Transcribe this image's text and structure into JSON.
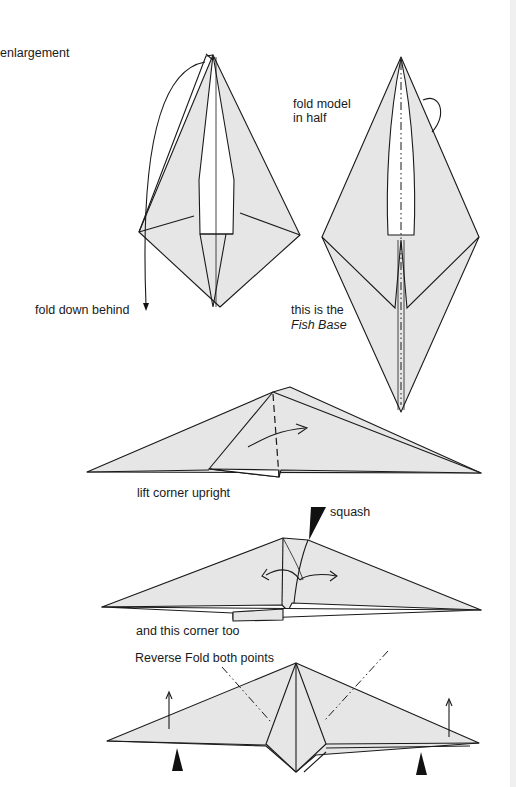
{
  "page": {
    "type": "origami instruction diagram",
    "colors": {
      "paper": "#e6e6e6",
      "ink": "#1a1a1a",
      "background": "#ffffff"
    }
  },
  "labels": {
    "enlargement": "enlargement",
    "fold_down_behind": "fold down behind",
    "fold_model_line1": "fold model",
    "fold_model_line2": "in half",
    "fish_base_line1": "this is the",
    "fish_base_line2": "Fish Base",
    "lift_corner": "lift corner upright",
    "squash": "squash",
    "this_corner_too": "and this corner too",
    "reverse_fold": "Reverse Fold both points"
  },
  "steps": [
    {
      "id": "step-1",
      "caption": "fold down behind",
      "symbols": [
        "curved-arrow",
        "down-arrow"
      ]
    },
    {
      "id": "step-2",
      "caption": "fold model in half / this is the Fish Base",
      "symbols": [
        "mountain-fold-line",
        "rotate-arrow"
      ]
    },
    {
      "id": "step-3",
      "caption": "lift corner upright",
      "symbols": [
        "valley-fold-line",
        "curved-arrow"
      ]
    },
    {
      "id": "step-4",
      "caption": "squash / and this corner too",
      "symbols": [
        "push-arrow",
        "double-curved-arrow"
      ]
    },
    {
      "id": "step-5",
      "caption": "Reverse Fold both points",
      "symbols": [
        "mountain-fold-line",
        "up-arrow",
        "push-arrow"
      ]
    }
  ]
}
